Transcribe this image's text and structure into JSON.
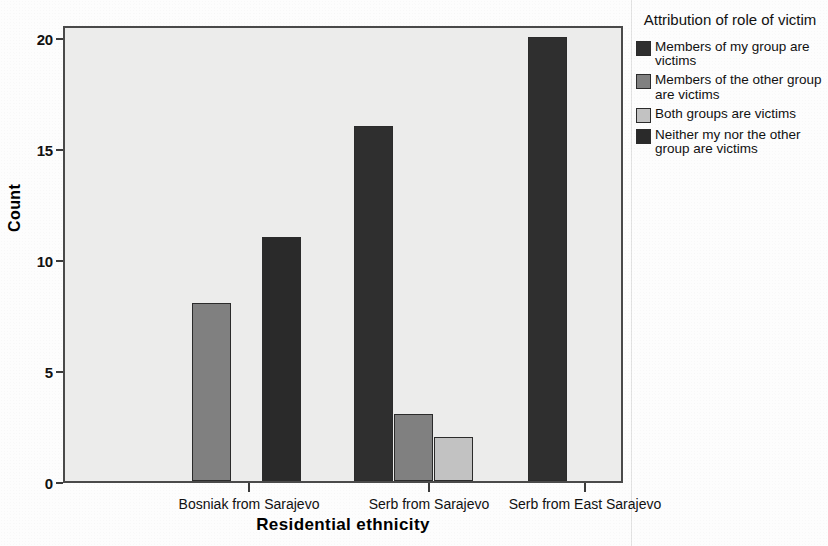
{
  "chart_data": {
    "type": "bar",
    "title": "",
    "xlabel": "Residential ethnicity",
    "ylabel": "Count",
    "ylim": [
      0,
      21
    ],
    "yticks": [
      0,
      5,
      10,
      15,
      20
    ],
    "grid": false,
    "legend_position": "right",
    "legend_title": "Attribution of role of victim",
    "categories": [
      "Bosniak from Sarajevo",
      "Serb from Sarajevo",
      "Serb from East Sarajevo"
    ],
    "series": [
      {
        "name": "Members of my group are victims",
        "color": "#2f2f2f",
        "values": [
          0,
          16,
          20
        ]
      },
      {
        "name": "Members of the other group are victims",
        "color": "#808080",
        "values": [
          8,
          3,
          0
        ]
      },
      {
        "name": "Both groups are victims",
        "color": "#c2c2c2",
        "values": [
          0,
          2,
          0
        ]
      },
      {
        "name": "Neither my nor the other group are victims",
        "color": "#2a2a2a",
        "values": [
          11,
          0,
          0
        ]
      }
    ],
    "bars": [
      {
        "category_index": 0,
        "series_index": 1,
        "value": 8,
        "x": 127,
        "width": 39
      },
      {
        "category_index": 0,
        "series_index": 3,
        "value": 11,
        "x": 197,
        "width": 39
      },
      {
        "category_index": 1,
        "series_index": 0,
        "value": 16,
        "x": 289,
        "width": 39
      },
      {
        "category_index": 1,
        "series_index": 1,
        "value": 3,
        "x": 329,
        "width": 39
      },
      {
        "category_index": 1,
        "series_index": 2,
        "value": 2,
        "x": 369,
        "width": 39
      },
      {
        "category_index": 2,
        "series_index": 0,
        "value": 20,
        "x": 463,
        "width": 39
      }
    ]
  },
  "axes": {
    "y_title": "Count",
    "x_title": "Residential ethnicity",
    "y_tick_labels": [
      "20",
      "15",
      "10",
      "5",
      "0"
    ],
    "x_tick_labels": [
      "Bosniak from Sarajevo",
      "Serb from Sarajevo",
      "Serb from East Sarajevo"
    ]
  },
  "legend": {
    "title": "Attribution of role of victim",
    "items": [
      {
        "label": "Members of my group are victims",
        "color": "#2f2f2f"
      },
      {
        "label": "Members of the other group are victims",
        "color": "#808080"
      },
      {
        "label": "Both groups are victims",
        "color": "#c2c2c2"
      },
      {
        "label": "Neither my nor the other group are victims",
        "color": "#2a2a2a"
      }
    ]
  },
  "style": {
    "plot_background": "#ececeb",
    "frame_color": "#4a4a4a",
    "bar_outline": "#2b2b2b"
  }
}
